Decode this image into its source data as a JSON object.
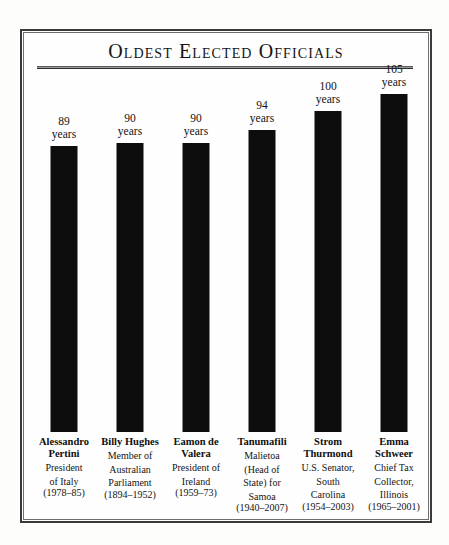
{
  "title": "Oldest Elected Officials",
  "chart_data": {
    "type": "bar",
    "title": "Oldest Elected Officials",
    "xlabel": "",
    "ylabel": "",
    "unit": "years",
    "ylim": [
      0,
      112
    ],
    "grid": false,
    "legend": "none",
    "bar_color": "#0d0d0d",
    "categories": [
      "Alessandro Pertini",
      "Billy Hughes",
      "Eamon de Valera",
      "Tanumafili",
      "Strom Thurmond",
      "Emma Schweer"
    ],
    "values": [
      89,
      90,
      90,
      94,
      100,
      105
    ],
    "value_labels": [
      "89",
      "90",
      "90",
      "94",
      "100",
      "105"
    ],
    "bars": [
      {
        "name": "Alessandro Pertini",
        "name_line1": "Alessandro",
        "name_line2": "Pertini",
        "value": 89,
        "value_label": "89",
        "unit": "years",
        "role": "President of Italy",
        "role_lines": [
          "President",
          "of Italy"
        ],
        "term": "(1978–85)"
      },
      {
        "name": "Billy Hughes",
        "name_line1": "Billy Hughes",
        "name_line2": "",
        "value": 90,
        "value_label": "90",
        "unit": "years",
        "role": "Member of Australian Parliament",
        "role_lines": [
          "Member of",
          "Australian",
          "Parliament"
        ],
        "term": "(1894–1952)"
      },
      {
        "name": "Eamon de Valera",
        "name_line1": "Eamon de",
        "name_line2": "Valera",
        "value": 90,
        "value_label": "90",
        "unit": "years",
        "role": "President of Ireland",
        "role_lines": [
          "President of",
          "Ireland"
        ],
        "term": "(1959–73)"
      },
      {
        "name": "Tanumafili",
        "name_line1": "Tanumafili",
        "name_line2": "",
        "value": 94,
        "value_label": "94",
        "unit": "years",
        "role": "Malietoa (Head of State) for Samoa",
        "role_lines": [
          "Malietoa",
          "(Head of",
          "State) for",
          "Samoa"
        ],
        "term": "(1940–2007)"
      },
      {
        "name": "Strom Thurmond",
        "name_line1": "Strom",
        "name_line2": "Thurmond",
        "value": 100,
        "value_label": "100",
        "unit": "years",
        "role": "U.S. Senator, South Carolina",
        "role_lines": [
          "U.S. Senator,",
          "South",
          "Carolina"
        ],
        "term": "(1954–2003)"
      },
      {
        "name": "Emma Schweer",
        "name_line1": "Emma",
        "name_line2": "Schweer",
        "value": 105,
        "value_label": "105",
        "unit": "years",
        "role": "Chief Tax Collector, Illinois",
        "role_lines": [
          "Chief Tax",
          "Collector,",
          "Illinois"
        ],
        "term": "(1965–2001)"
      }
    ]
  }
}
